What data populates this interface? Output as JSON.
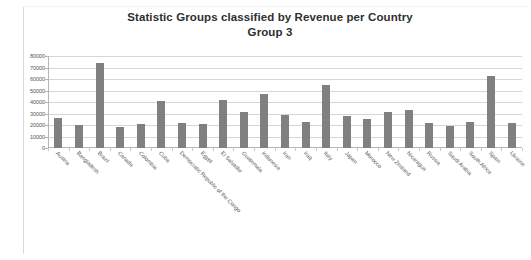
{
  "chart_data": {
    "type": "bar",
    "title": "Statistic Groups classified by Revenue per Country Group 3",
    "title_line1": "Statistic Groups classified by Revenue per Country",
    "title_line2": "Group 3",
    "xlabel": "",
    "ylabel": "",
    "ylim": [
      0,
      80000
    ],
    "ytick_step": 10000,
    "grid": true,
    "legend": false,
    "bar_color": "#808080",
    "categories": [
      "Austria",
      "Bangladesh",
      "Brazil",
      "Canada",
      "Colombia",
      "Cuba",
      "Democratic Republic of the Congo",
      "Egypt",
      "El Salvador",
      "Guatemala",
      "Indonesia",
      "Iran",
      "Iraq",
      "Italy",
      "Japan",
      "Morocco",
      "New Zealand",
      "Nicaragua",
      "Russia",
      "Saudi Arabia",
      "South Africa",
      "Spain",
      "Ukraine"
    ],
    "values": [
      26000,
      20000,
      74000,
      18500,
      21000,
      41000,
      22000,
      20500,
      42000,
      31000,
      47000,
      29000,
      22500,
      55000,
      28000,
      25000,
      31000,
      33000,
      22000,
      19500,
      23000,
      63000,
      22000
    ],
    "ytick_labels": [
      "80000",
      "70000",
      "60000",
      "50000",
      "40000",
      "30000",
      "20000",
      "10000",
      "0"
    ]
  }
}
